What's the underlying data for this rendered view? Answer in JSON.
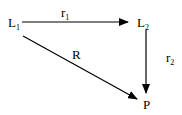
{
  "diagram": {
    "nodes": [
      {
        "id": "L1",
        "label": "L",
        "subscript": "1"
      },
      {
        "id": "L2",
        "label": "L",
        "subscript": "2"
      },
      {
        "id": "P",
        "label": "P",
        "subscript": ""
      }
    ],
    "edges": [
      {
        "from": "L1",
        "to": "L2",
        "label": "r",
        "subscript": "1"
      },
      {
        "from": "L2",
        "to": "P",
        "label": "r",
        "subscript": "2"
      },
      {
        "from": "L1",
        "to": "P",
        "label": "R",
        "subscript": ""
      }
    ],
    "colors": {
      "stroke": "#000000",
      "background": "#ffffff"
    }
  }
}
